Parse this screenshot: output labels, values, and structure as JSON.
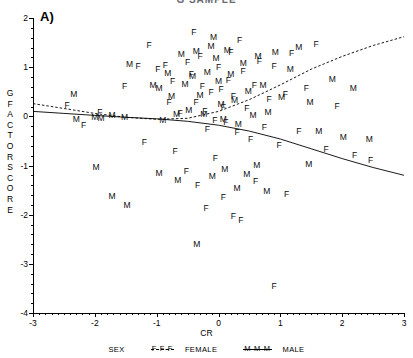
{
  "figure": {
    "clipped_title": "G  SAMPLE",
    "panel_label": "A)"
  },
  "axes": {
    "x_title": "CR",
    "y_title_letters": [
      "G",
      "F",
      "A",
      "C",
      "T",
      "O",
      "R",
      "S",
      "C",
      "O",
      "R",
      "E"
    ],
    "x_ticks": [
      "-3",
      "-2",
      "-1",
      "0",
      "1",
      "2",
      "3"
    ],
    "y_ticks": [
      "2",
      "1",
      "0",
      "-1",
      "-2",
      "-3",
      "-4"
    ]
  },
  "legend": {
    "title": "SEX",
    "female_mark": "F-F-F",
    "female_label": "FEMALE",
    "male_mark": "M-M-M",
    "male_label": "MALE"
  },
  "chart_data": {
    "type": "scatter",
    "title": "G  SAMPLE",
    "xlabel": "CR",
    "ylabel": "G FACTOR SCORE",
    "xlim": [
      -3,
      3
    ],
    "ylim": [
      -4,
      2
    ],
    "grid": false,
    "legend_position": "bottom",
    "point_marker_is_group_letter": true,
    "series": [
      {
        "name": "FEMALE",
        "marker": "F",
        "fit_line_style": "dashed",
        "points": [
          [
            -2.18,
            -0.18
          ],
          [
            -1.52,
            0.62
          ],
          [
            -1.3,
            1.03
          ],
          [
            -1.12,
            1.46
          ],
          [
            -0.98,
            0.97
          ],
          [
            -0.86,
            1.05
          ],
          [
            -0.8,
            0.3
          ],
          [
            -0.74,
            0.72
          ],
          [
            -0.62,
            0.06
          ],
          [
            -0.5,
            1.1
          ],
          [
            -0.44,
            0.86
          ],
          [
            -0.4,
            1.72
          ],
          [
            -0.36,
            0.3
          ],
          [
            -0.3,
            1.22
          ],
          [
            -0.26,
            0.62
          ],
          [
            -0.22,
            0.1
          ],
          [
            -0.18,
            -0.26
          ],
          [
            -0.12,
            0.5
          ],
          [
            -0.06,
            -0.08
          ],
          [
            0.0,
            1.0
          ],
          [
            0.04,
            0.56
          ],
          [
            0.08,
            0.2
          ],
          [
            0.12,
            -0.12
          ],
          [
            0.16,
            0.74
          ],
          [
            0.2,
            1.3
          ],
          [
            0.24,
            0.42
          ],
          [
            0.3,
            -0.32
          ],
          [
            0.34,
            1.55
          ],
          [
            0.4,
            0.92
          ],
          [
            0.46,
            0.18
          ],
          [
            0.52,
            -0.46
          ],
          [
            0.58,
            0.64
          ],
          [
            0.66,
            1.12
          ],
          [
            0.74,
            -0.22
          ],
          [
            0.82,
            0.36
          ],
          [
            0.9,
            1.02
          ],
          [
            0.98,
            -0.58
          ],
          [
            1.08,
            0.46
          ],
          [
            1.18,
            1.28
          ],
          [
            1.3,
            -0.3
          ],
          [
            1.42,
            0.58
          ],
          [
            1.58,
            1.48
          ],
          [
            1.74,
            -0.66
          ],
          [
            1.92,
            0.22
          ],
          [
            2.2,
            -0.78
          ],
          [
            2.46,
            -0.88
          ],
          [
            -1.92,
            0.08
          ],
          [
            -1.2,
            -0.52
          ],
          [
            -0.7,
            -0.7
          ],
          [
            -0.52,
            -1.12
          ],
          [
            -0.34,
            -1.4
          ],
          [
            -0.2,
            -1.86
          ],
          [
            0.08,
            -1.64
          ],
          [
            0.24,
            -2.02
          ],
          [
            0.36,
            -2.1
          ],
          [
            0.6,
            -1.32
          ],
          [
            0.9,
            -3.45
          ],
          [
            1.1,
            -1.58
          ],
          [
            -2.45,
            0.24
          ],
          [
            -0.05,
            -0.84
          ]
        ]
      },
      {
        "name": "MALE",
        "marker": "M",
        "fit_line_style": "solid",
        "points": [
          [
            -2.34,
            0.46
          ],
          [
            -2.0,
            -0.02
          ],
          [
            -1.9,
            -0.04
          ],
          [
            -1.72,
            0.02
          ],
          [
            -1.52,
            -0.02
          ],
          [
            -1.44,
            1.06
          ],
          [
            -1.06,
            0.64
          ],
          [
            -0.96,
            0.58
          ],
          [
            -0.9,
            -0.08
          ],
          [
            -0.82,
            0.88
          ],
          [
            -0.76,
            0.42
          ],
          [
            -0.68,
            0.04
          ],
          [
            -0.6,
            1.26
          ],
          [
            -0.54,
            0.66
          ],
          [
            -0.48,
            0.12
          ],
          [
            -0.42,
            0.82
          ],
          [
            -0.36,
            1.32
          ],
          [
            -0.3,
            0.44
          ],
          [
            -0.24,
            0.04
          ],
          [
            -0.18,
            0.9
          ],
          [
            -0.12,
            1.44
          ],
          [
            -0.08,
            1.62
          ],
          [
            -0.04,
            1.18
          ],
          [
            0.0,
            0.72
          ],
          [
            0.04,
            0.26
          ],
          [
            0.08,
            -0.06
          ],
          [
            0.14,
            1.36
          ],
          [
            0.2,
            0.86
          ],
          [
            0.26,
            0.34
          ],
          [
            0.32,
            -0.16
          ],
          [
            0.4,
            1.08
          ],
          [
            0.48,
            0.52
          ],
          [
            0.56,
            0.02
          ],
          [
            0.64,
            1.22
          ],
          [
            0.72,
            0.64
          ],
          [
            0.8,
            0.08
          ],
          [
            0.92,
            1.3
          ],
          [
            1.02,
            0.4
          ],
          [
            1.16,
            0.96
          ],
          [
            1.3,
            1.42
          ],
          [
            1.48,
            0.3
          ],
          [
            1.62,
            -0.3
          ],
          [
            1.84,
            0.76
          ],
          [
            2.02,
            -0.42
          ],
          [
            2.18,
            0.58
          ],
          [
            2.44,
            -0.46
          ],
          [
            -1.98,
            -1.02
          ],
          [
            -1.72,
            -1.62
          ],
          [
            -1.48,
            -1.8
          ],
          [
            -0.96,
            -1.16
          ],
          [
            -0.66,
            -1.3
          ],
          [
            -0.35,
            -2.6
          ],
          [
            -0.1,
            -1.22
          ],
          [
            0.1,
            -1.08
          ],
          [
            0.3,
            -1.46
          ],
          [
            0.46,
            -1.18
          ],
          [
            0.62,
            -0.98
          ],
          [
            0.78,
            -1.52
          ],
          [
            1.46,
            -0.96
          ],
          [
            -2.3,
            -0.06
          ]
        ]
      }
    ],
    "fit_curves": [
      {
        "name": "FEMALE fit",
        "style": "dashed",
        "points": [
          [
            -3,
            0.26
          ],
          [
            -2.5,
            0.16
          ],
          [
            -2,
            0.06
          ],
          [
            -1.5,
            -0.02
          ],
          [
            -1,
            -0.06
          ],
          [
            -0.5,
            -0.04
          ],
          [
            0,
            0.1
          ],
          [
            0.5,
            0.34
          ],
          [
            1,
            0.64
          ],
          [
            1.5,
            0.96
          ],
          [
            2,
            1.22
          ],
          [
            2.5,
            1.44
          ],
          [
            3,
            1.62
          ]
        ]
      },
      {
        "name": "MALE fit",
        "style": "solid",
        "points": [
          [
            -3,
            0.1
          ],
          [
            -2.5,
            0.06
          ],
          [
            -2,
            0.02
          ],
          [
            -1.5,
            -0.02
          ],
          [
            -1,
            -0.05
          ],
          [
            -0.5,
            -0.1
          ],
          [
            0,
            -0.18
          ],
          [
            0.5,
            -0.3
          ],
          [
            1,
            -0.46
          ],
          [
            1.5,
            -0.66
          ],
          [
            2,
            -0.86
          ],
          [
            2.5,
            -1.04
          ],
          [
            3,
            -1.2
          ]
        ]
      }
    ]
  }
}
